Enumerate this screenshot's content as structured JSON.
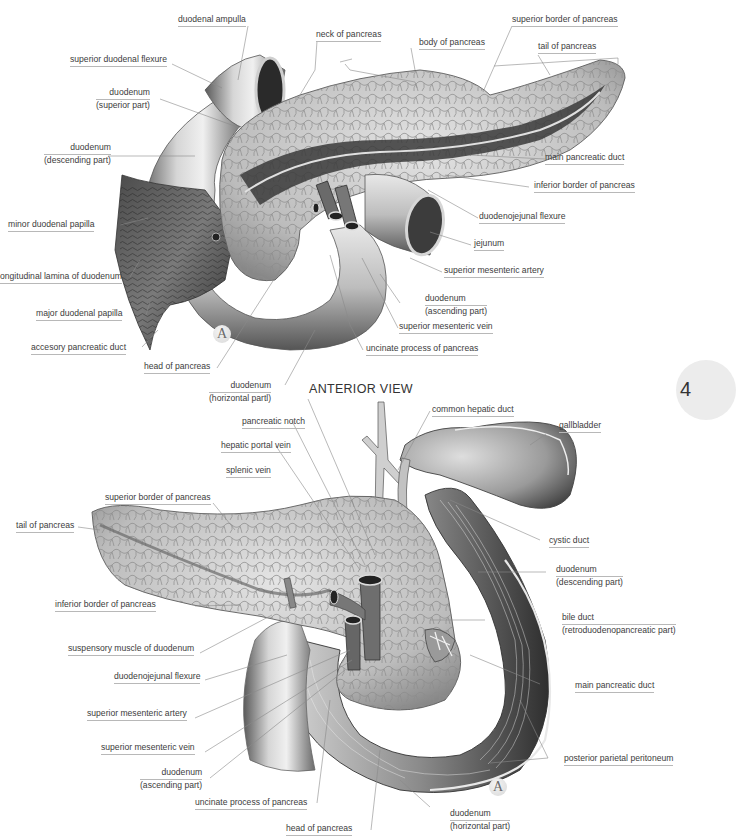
{
  "figure": {
    "view_title": "ANTERIOR VIEW",
    "badge_letter": "A",
    "chapter_tab": "4",
    "colors": {
      "background": "#ffffff",
      "label_text": "#3c3c3c",
      "leader_line": "#8a8a8a",
      "tissue_light": "#e6e6e6",
      "tissue_mid": "#b4b4b4",
      "tissue_dark": "#3a3a3a"
    }
  },
  "top_panel": {
    "labels": [
      {
        "id": "duodenal-ampulla",
        "text": [
          "duodenal ampulla"
        ]
      },
      {
        "id": "neck-of-pancreas",
        "text": [
          "neck of pancreas"
        ]
      },
      {
        "id": "body-of-pancreas",
        "text": [
          "body of pancreas"
        ]
      },
      {
        "id": "superior-border-of-pancreas",
        "text": [
          "superior border of pancreas"
        ]
      },
      {
        "id": "tail-of-pancreas",
        "text": [
          "tail of pancreas"
        ]
      },
      {
        "id": "superior-duodenal-flexure",
        "text": [
          "superior duodenal flexure"
        ]
      },
      {
        "id": "duodenum-superior-part",
        "text": [
          "duodenum",
          "(superior part)"
        ]
      },
      {
        "id": "duodenum-descending-part",
        "text": [
          "duodenum",
          "(descending part)"
        ]
      },
      {
        "id": "main-pancreatic-duct",
        "text": [
          "main pancreatic duct"
        ]
      },
      {
        "id": "inferior-border-of-pancreas",
        "text": [
          "inferior border of pancreas"
        ]
      },
      {
        "id": "duodenojejunal-flexure",
        "text": [
          "duodenojejunal flexure"
        ]
      },
      {
        "id": "minor-duodenal-papilla",
        "text": [
          "minor duodenal papilla"
        ]
      },
      {
        "id": "jejunum",
        "text": [
          "jejunum"
        ]
      },
      {
        "id": "longitudinal-lamina-of-duodenum",
        "text": [
          "ongitudinal lamina of duodenum"
        ]
      },
      {
        "id": "superior-mesenteric-artery",
        "text": [
          "superior mesenteric artery"
        ]
      },
      {
        "id": "major-duodenal-papilla",
        "text": [
          "major duodenal papilla"
        ]
      },
      {
        "id": "duodenum-ascending-part",
        "text": [
          "duodenum",
          "(ascending part)"
        ]
      },
      {
        "id": "superior-mesenteric-vein",
        "text": [
          "superior mesenteric vein"
        ]
      },
      {
        "id": "accesory-pancreatic-duct",
        "text": [
          "accesory pancreatic duct"
        ]
      },
      {
        "id": "uncinate-process-of-pancreas",
        "text": [
          "uncinate process of pancreas"
        ]
      },
      {
        "id": "head-of-pancreas",
        "text": [
          "head of pancreas"
        ]
      },
      {
        "id": "duodenum-horizontal-part",
        "text": [
          "duodenum",
          "(horizontal partl)"
        ]
      }
    ]
  },
  "bottom_panel": {
    "labels": [
      {
        "id": "common-hepatic-duct",
        "text": [
          "common hepatic duct"
        ]
      },
      {
        "id": "pancreatic-notch",
        "text": [
          "pancreatic notch"
        ]
      },
      {
        "id": "gallbladder",
        "text": [
          "gallbladder"
        ]
      },
      {
        "id": "hepatic-portal-vein",
        "text": [
          "hepatic portal vein"
        ]
      },
      {
        "id": "splenic-vein",
        "text": [
          "splenic vein"
        ]
      },
      {
        "id": "superior-border-of-pancreas",
        "text": [
          "superior border of pancreas"
        ]
      },
      {
        "id": "tail-of-pancreas",
        "text": [
          "tail of pancreas"
        ]
      },
      {
        "id": "cystic-duct",
        "text": [
          "cystic duct"
        ]
      },
      {
        "id": "duodenum-descending-part",
        "text": [
          "duodenum",
          "(descending part)"
        ]
      },
      {
        "id": "inferior-border-of-pancreas",
        "text": [
          "inferior border of pancreas"
        ]
      },
      {
        "id": "bile-duct",
        "text": [
          "bile duct",
          "(retroduodenopancreatic part)"
        ]
      },
      {
        "id": "suspensory-muscle-of-duodenum",
        "text": [
          "suspensory muscle of duodenum"
        ]
      },
      {
        "id": "duodenojejunal-flexure",
        "text": [
          "duodenojejunal flexure"
        ]
      },
      {
        "id": "main-pancreatic-duct",
        "text": [
          "main pancreatic duct"
        ]
      },
      {
        "id": "superior-mesenteric-artery",
        "text": [
          "superior mesenteric artery"
        ]
      },
      {
        "id": "superior-mesenteric-vein",
        "text": [
          "superior mesenteric vein"
        ]
      },
      {
        "id": "posterior-parietal-peritoneum",
        "text": [
          "posterior parietal peritoneum"
        ]
      },
      {
        "id": "duodenum-ascending-part",
        "text": [
          "duodenum",
          "(ascending part)"
        ]
      },
      {
        "id": "uncinate-process-of-pancreas",
        "text": [
          "uncinate process of pancreas"
        ]
      },
      {
        "id": "duodenum-horizontal-part",
        "text": [
          "duodenum",
          "(horizontal part)"
        ]
      },
      {
        "id": "head-of-pancreas",
        "text": [
          "head of pancreas"
        ]
      }
    ]
  }
}
